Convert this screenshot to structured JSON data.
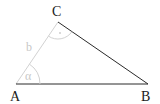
{
  "diagram": {
    "type": "triangle",
    "vertices": {
      "A": {
        "label": "A",
        "x": 16,
        "y": 84
      },
      "B": {
        "label": "B",
        "x": 148,
        "y": 84
      },
      "C": {
        "label": "C",
        "x": 58,
        "y": 22
      }
    },
    "sides": {
      "b": {
        "label": "b",
        "from": "A",
        "to": "C",
        "color": "#d0d0d0"
      },
      "c": {
        "label": "",
        "from": "A",
        "to": "B",
        "color": "#2a2a2a"
      },
      "a": {
        "label": "",
        "from": "B",
        "to": "C",
        "color": "#2a2a2a"
      }
    },
    "angles": {
      "alpha": {
        "label": "α",
        "at": "A"
      },
      "gamma": {
        "label": "·",
        "at": "C"
      }
    },
    "colors": {
      "dark": "#2a2a2a",
      "light": "#d0d0d0"
    }
  }
}
